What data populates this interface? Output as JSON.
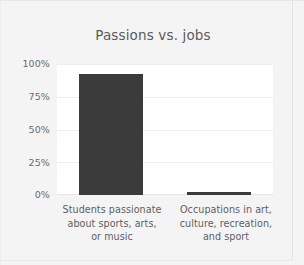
{
  "chart_data": {
    "type": "bar",
    "title": "Passions vs. jobs",
    "xlabel": "",
    "ylabel": "",
    "categories": [
      "Students passionate about sports, arts, or music",
      "Occupations in art, culture, recreation, and sport"
    ],
    "category_lines": [
      [
        "Students passionate",
        "about sports, arts,",
        "or music"
      ],
      [
        "Occupations in art,",
        "culture, recreation,",
        "and sport"
      ]
    ],
    "values": [
      92,
      2
    ],
    "value_labels": [
      "92%",
      "2%"
    ],
    "ylim": [
      0,
      100
    ],
    "yticks": [
      0,
      25,
      50,
      75,
      100
    ],
    "ytick_labels": [
      "0%",
      "25%",
      "50%",
      "75%",
      "100%"
    ],
    "grid": true,
    "legend": false,
    "legend_position": "none",
    "bar_color": "#3b3b3b",
    "plot_background": "#ffffff",
    "figure_background": "#f4f4f4",
    "grid_color": "#eeeeee",
    "text_color": "#606060",
    "title_color": "#5a5a5a"
  }
}
